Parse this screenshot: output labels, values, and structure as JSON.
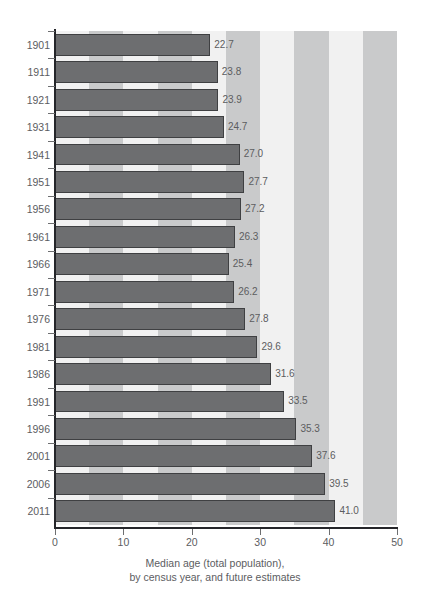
{
  "chart_data": {
    "type": "bar",
    "orientation": "horizontal",
    "title": "",
    "xlabel": "Median age (total population), by census year, and future estimates",
    "ylabel": "",
    "xlim": [
      0,
      50
    ],
    "xticks": [
      0,
      10,
      20,
      30,
      40,
      50
    ],
    "xtick_labels": [
      "0",
      "10",
      "20",
      "30",
      "40",
      "50"
    ],
    "grid": false,
    "legend": "none",
    "categories": [
      "1901",
      "1911",
      "1921",
      "1931",
      "1941",
      "1951",
      "1956",
      "1961",
      "1966",
      "1971",
      "1976",
      "1981",
      "1986",
      "1991",
      "1996",
      "2001",
      "2006",
      "2011"
    ],
    "values": [
      22.7,
      23.8,
      23.9,
      24.7,
      27.0,
      27.7,
      27.2,
      26.3,
      25.4,
      26.2,
      27.8,
      29.6,
      31.6,
      33.5,
      35.3,
      37.6,
      39.5,
      41.0
    ],
    "value_labels": [
      "22.7",
      "23.8",
      "23.9",
      "24.7",
      "27.0",
      "27.7",
      "27.2",
      "26.3",
      "25.4",
      "26.2",
      "27.8",
      "29.6",
      "31.6",
      "33.5",
      "35.3",
      "37.6",
      "39.5",
      "41.0"
    ],
    "bar_color": "#6d6e70",
    "bar_edge_color": "#3f4042",
    "background_bands": {
      "band_width_units": 5,
      "light_color": "#f1f1f1",
      "dark_color": "#c9cacb"
    }
  },
  "caption": {
    "line1": "Median age (total population),",
    "line2": "by census year, and future estimates"
  },
  "axes": {
    "x_tick_labels": [
      "0",
      "10",
      "20",
      "30",
      "40",
      "50"
    ],
    "y_tick_labels": [
      "1901",
      "1911",
      "1921",
      "1931",
      "1941",
      "1951",
      "1956",
      "1961",
      "1966",
      "1971",
      "1976",
      "1981",
      "1986",
      "1991",
      "1996",
      "2001",
      "2006",
      "2011"
    ]
  },
  "colors": {
    "axis": "#25262a",
    "text": "#5c5d5f",
    "bar": "#6d6e70",
    "band_light": "#f1f1f1",
    "band_dark": "#c9cacb"
  }
}
